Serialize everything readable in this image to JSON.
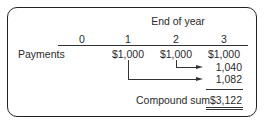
{
  "table": {
    "header_title": "End of year",
    "columns": [
      "0",
      "1",
      "2",
      "3"
    ],
    "rows": [
      {
        "label": "Payments",
        "values": [
          "",
          "$1,000",
          "$1,000",
          "$1,000"
        ]
      }
    ],
    "compounded_values": [
      {
        "from_year": "2",
        "to_year": "3",
        "value": "1,040"
      },
      {
        "from_year": "1",
        "to_year": "3",
        "value": "1,082"
      }
    ],
    "total": {
      "label": "Compound sum",
      "value": "$3,122"
    }
  }
}
